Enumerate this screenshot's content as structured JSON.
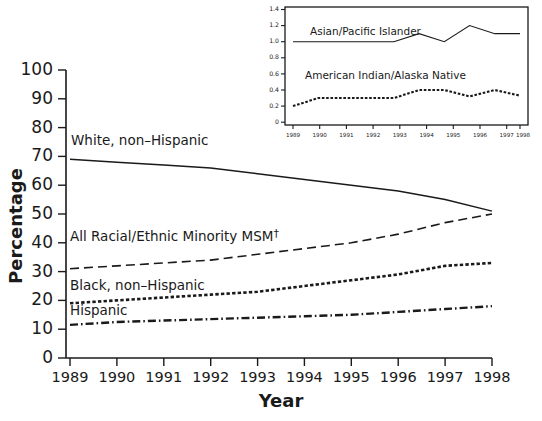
{
  "chart_data": {
    "type": "line",
    "title": "",
    "xlabel": "Year",
    "ylabel": "Percentage",
    "xlim": [
      1989,
      1998
    ],
    "ylim": [
      0,
      100
    ],
    "grid": false,
    "legend_position": "inline-annotations",
    "x": [
      1989,
      1990,
      1991,
      1992,
      1993,
      1994,
      1995,
      1996,
      1997,
      1998
    ],
    "series": [
      {
        "name": "White, non-Hispanic",
        "style": "solid",
        "values": [
          69,
          68,
          67,
          66,
          64,
          62,
          60,
          58,
          55,
          51
        ]
      },
      {
        "name": "All Racial/Ethnic Minority MSM†",
        "style": "dashed",
        "values": [
          31,
          32,
          33,
          34,
          36,
          38,
          40,
          43,
          47,
          50
        ]
      },
      {
        "name": "Black, non-Hispanic",
        "style": "dotted",
        "values": [
          19,
          20,
          21,
          22,
          23,
          25,
          27,
          29,
          32,
          33
        ]
      },
      {
        "name": "Hispanic",
        "style": "dash-dot",
        "values": [
          11.5,
          12.5,
          13,
          13.5,
          14,
          14.5,
          15,
          16,
          17,
          18
        ]
      }
    ],
    "yticks": [
      0,
      10,
      20,
      30,
      40,
      50,
      60,
      70,
      80,
      90,
      100
    ],
    "xticks": [
      1989,
      1990,
      1991,
      1992,
      1993,
      1994,
      1995,
      1996,
      1997,
      1998
    ],
    "inset": {
      "type": "line",
      "xlabel": "",
      "ylabel": "",
      "xlim": [
        1989,
        1998
      ],
      "ylim": [
        0,
        1.4
      ],
      "yticks": [
        "0",
        "0.2",
        "0.4",
        "0.6",
        "0.8",
        "1.0",
        "1.2",
        "1.4"
      ],
      "ytick_values": [
        0,
        0.2,
        0.4,
        0.6,
        0.8,
        1.0,
        1.2,
        1.4
      ],
      "xticks": [
        1989,
        1990,
        1991,
        1992,
        1993,
        1994,
        1995,
        1996,
        1997,
        1998
      ],
      "x": [
        1989,
        1990,
        1991,
        1992,
        1993,
        1994,
        1995,
        1996,
        1997,
        1998
      ],
      "series": [
        {
          "name": "Asian/Pacific Islander",
          "style": "solid",
          "values": [
            1.0,
            1.0,
            1.0,
            1.0,
            1.0,
            1.1,
            1.0,
            1.2,
            1.1,
            1.1
          ]
        },
        {
          "name": "American Indian/Alaska Native",
          "style": "dotted",
          "values": [
            0.2,
            0.3,
            0.3,
            0.3,
            0.3,
            0.4,
            0.4,
            0.32,
            0.4,
            0.33
          ]
        }
      ]
    }
  },
  "axes": {
    "y_title": "Percentage",
    "x_title": "Year",
    "y_labels": [
      "100",
      "90",
      "80",
      "70",
      "60",
      "50",
      "40",
      "30",
      "20",
      "10",
      "0"
    ],
    "x_labels": [
      "1989",
      "1990",
      "1991",
      "1992",
      "1993",
      "1994",
      "1995",
      "1996",
      "1997",
      "1998"
    ]
  },
  "annotations": {
    "white": "White, non–Hispanic",
    "minority_main": "All Racial/Ethnic Minority MSM",
    "minority_dagger": "†",
    "black": "Black, non–Hispanic",
    "hispanic": "Hispanic"
  },
  "inset_labels": {
    "asian": "Asian/Pacific Islander",
    "native": "American Indian/Alaska Native",
    "y_labels": [
      "1.4",
      "1.2",
      "1.0",
      "0.8",
      "0.6",
      "0.4",
      "0.2",
      "0"
    ],
    "x_labels": [
      "1989",
      "1990",
      "1991",
      "1992",
      "1993",
      "1994",
      "1995",
      "1996",
      "1997",
      "1998"
    ]
  },
  "colors": {
    "ink": "#1a1a1a",
    "background": "#ffffff"
  }
}
